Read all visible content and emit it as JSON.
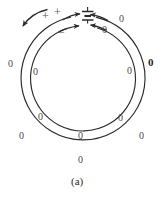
{
  "figure": {
    "caption": "(a)",
    "description_labels": {
      "plus_1": "+",
      "plus_2": "+",
      "minus_1": "−"
    },
    "zero_labels": [
      {
        "id": "outer-left",
        "text": "0",
        "x": 8,
        "y": 59,
        "bold": false
      },
      {
        "id": "inner-left-upper",
        "text": "0",
        "x": 33,
        "y": 67,
        "bold": false
      },
      {
        "id": "inner-right-upper-near-gap",
        "text": "0",
        "x": 102,
        "y": 25,
        "bold": false
      },
      {
        "id": "outer-right-upper",
        "text": "0",
        "x": 119,
        "y": 14,
        "bold": false
      },
      {
        "id": "inner-right-upper",
        "text": "0",
        "x": 127,
        "y": 66,
        "bold": false
      },
      {
        "id": "outer-right",
        "text": "0",
        "x": 148,
        "y": 57,
        "bold": true
      },
      {
        "id": "inner-left-lower",
        "text": "0",
        "x": 38,
        "y": 112,
        "bold": false
      },
      {
        "id": "outer-left-lower",
        "text": "0",
        "x": 19,
        "y": 131,
        "bold": false
      },
      {
        "id": "inner-right-lower",
        "text": "0",
        "x": 118,
        "y": 113,
        "bold": false
      },
      {
        "id": "outer-right-lower",
        "text": "0",
        "x": 139,
        "y": 131,
        "bold": false
      },
      {
        "id": "inner-bottom",
        "text": "0",
        "x": 78,
        "y": 131,
        "bold": false
      },
      {
        "id": "outer-bottom",
        "text": "0",
        "x": 78,
        "y": 155,
        "bold": false
      }
    ],
    "colors": {
      "stroke": "#2b2b2b",
      "label": "#4a4a4a",
      "bold_label": "#1f1f1f",
      "background": "#ffffff"
    }
  }
}
